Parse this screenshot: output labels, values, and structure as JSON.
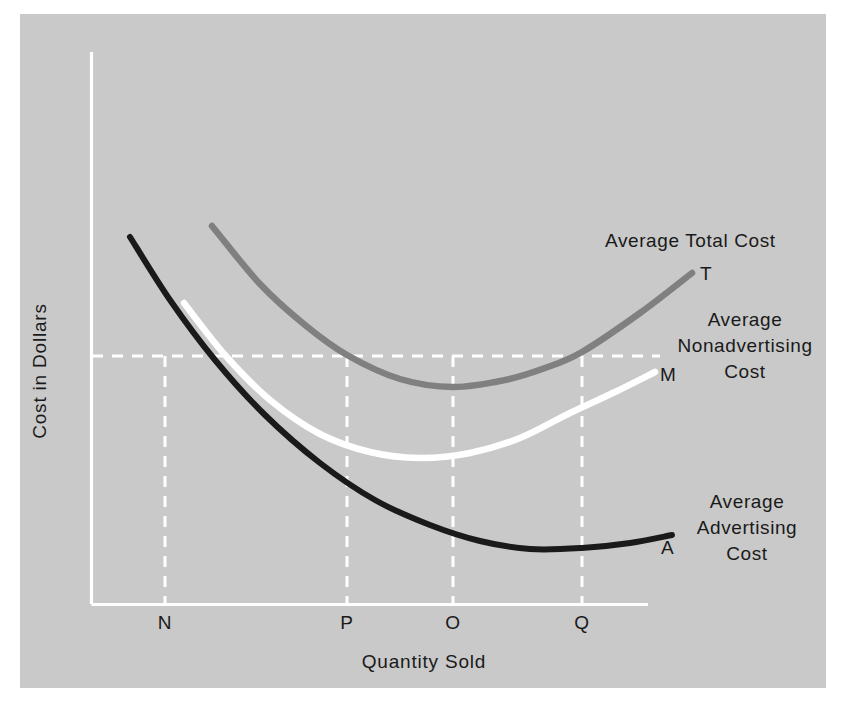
{
  "figure": {
    "background_color": "#c9c9c9",
    "page_color": "#ffffff",
    "axis_color": "#ffffff"
  },
  "chart_data": {
    "type": "line",
    "title": "",
    "subtitle": "",
    "xlabel": "Quantity Sold",
    "ylabel": "Cost in Dollars",
    "grid": true,
    "grid_style": "dashed-white-reference-lines",
    "legend_position": "inline-right-annotations",
    "axis_ticks_x": [
      "N",
      "P",
      "O",
      "Q"
    ],
    "axis_ticks_y": [],
    "xlim_labels": [
      "0",
      ""
    ],
    "ylim_labels": [
      "0",
      ""
    ],
    "series": [
      {
        "name": "Average Total Cost",
        "end_point_label": "T",
        "color": "#808080",
        "label_lines": [
          "Average Total Cost"
        ],
        "minimum_at_tick": "O",
        "crosses_reference_level_at": [
          "P",
          "Q"
        ],
        "points": [
          {
            "x": 212,
            "y": 226
          },
          {
            "x": 260,
            "y": 284
          },
          {
            "x": 305,
            "y": 325
          },
          {
            "x": 347,
            "y": 355
          },
          {
            "x": 400,
            "y": 379
          },
          {
            "x": 453,
            "y": 387
          },
          {
            "x": 505,
            "y": 380
          },
          {
            "x": 545,
            "y": 368
          },
          {
            "x": 582,
            "y": 352
          },
          {
            "x": 640,
            "y": 313
          },
          {
            "x": 692,
            "y": 273
          }
        ]
      },
      {
        "name": "Average Nonadvertising Cost",
        "end_point_label": "M",
        "color": "#ffffff",
        "label_lines": [
          "Average",
          "Nonadvertising",
          "Cost"
        ],
        "minimum_at_tick": "O",
        "points": [
          {
            "x": 184,
            "y": 303
          },
          {
            "x": 225,
            "y": 355
          },
          {
            "x": 270,
            "y": 400
          },
          {
            "x": 320,
            "y": 434
          },
          {
            "x": 370,
            "y": 452
          },
          {
            "x": 420,
            "y": 458
          },
          {
            "x": 470,
            "y": 453
          },
          {
            "x": 520,
            "y": 438
          },
          {
            "x": 570,
            "y": 413
          },
          {
            "x": 615,
            "y": 392
          },
          {
            "x": 655,
            "y": 372
          }
        ]
      },
      {
        "name": "Average Advertising Cost",
        "end_point_label": "A",
        "color": "#1a1a1a",
        "label_lines": [
          "Average",
          "Advertising",
          "Cost"
        ],
        "minimum_at_tick": "between O and Q",
        "points": [
          {
            "x": 130,
            "y": 237
          },
          {
            "x": 170,
            "y": 300
          },
          {
            "x": 215,
            "y": 360
          },
          {
            "x": 265,
            "y": 415
          },
          {
            "x": 320,
            "y": 463
          },
          {
            "x": 375,
            "y": 500
          },
          {
            "x": 430,
            "y": 525
          },
          {
            "x": 480,
            "y": 541
          },
          {
            "x": 530,
            "y": 549
          },
          {
            "x": 582,
            "y": 548
          },
          {
            "x": 630,
            "y": 543
          },
          {
            "x": 672,
            "y": 535
          }
        ]
      }
    ],
    "reference_lines": [
      {
        "orientation": "horizontal",
        "label": "",
        "y": 356,
        "x_from": 92,
        "x_to": 660
      },
      {
        "orientation": "vertical",
        "label": "N",
        "x": 165,
        "y_from": 356,
        "y_to": 604
      },
      {
        "orientation": "vertical",
        "label": "P",
        "x": 347,
        "y_from": 356,
        "y_to": 604
      },
      {
        "orientation": "vertical",
        "label": "O",
        "x": 453,
        "y_from": 356,
        "y_to": 604
      },
      {
        "orientation": "vertical",
        "label": "Q",
        "x": 582,
        "y_from": 356,
        "y_to": 604
      }
    ]
  },
  "axes": {
    "y_title": "Cost in Dollars",
    "x_title": "Quantity Sold",
    "x_ticks": [
      {
        "label": "N",
        "x": 165
      },
      {
        "label": "P",
        "x": 347
      },
      {
        "label": "O",
        "x": 453
      },
      {
        "label": "Q",
        "x": 582
      }
    ]
  },
  "annotations": {
    "total_cost": {
      "text": "Average Total Cost",
      "point_label": "T"
    },
    "nonadvertising_cost": {
      "line1": "Average",
      "line2": "Nonadvertising",
      "line3": "Cost",
      "point_label": "M"
    },
    "advertising_cost": {
      "line1": "Average",
      "line2": "Advertising",
      "line3": "Cost",
      "point_label": "A"
    }
  }
}
